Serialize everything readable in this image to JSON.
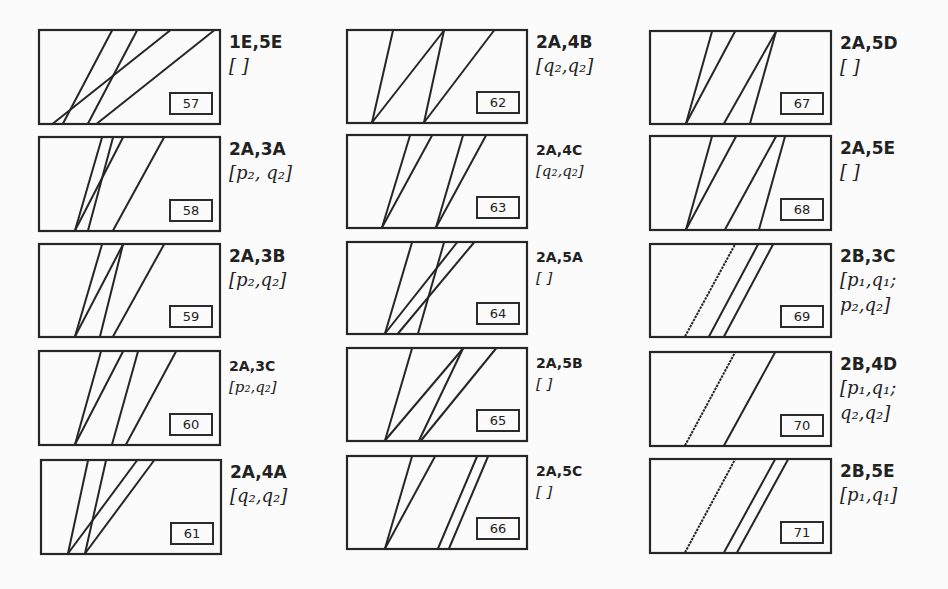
{
  "figure": {
    "panels": [
      {
        "id": "57",
        "x": 38,
        "y": 29,
        "w": 183,
        "h": 96,
        "code": "1E,5E",
        "state": "[ ]",
        "size": "big",
        "lines": [
          [
            15,
            132
          ],
          [
            25,
            74
          ],
          [
            50,
            99
          ],
          [
            59,
            176
          ]
        ],
        "dashed": []
      },
      {
        "id": "58",
        "x": 38,
        "y": 136,
        "w": 183,
        "h": 96,
        "code": "2A,3A",
        "state": "[p₂, q₂]",
        "size": "big",
        "lines": [
          [
            37,
            64
          ],
          [
            37,
            85
          ],
          [
            50,
            75
          ],
          [
            75,
            126
          ]
        ],
        "dashed": []
      },
      {
        "id": "59",
        "x": 38,
        "y": 243,
        "w": 183,
        "h": 95,
        "code": "2A,3B",
        "state": "[p₂,q₂]",
        "size": "big",
        "lines": [
          [
            37,
            64
          ],
          [
            37,
            85
          ],
          [
            62,
            85
          ],
          [
            75,
            126
          ]
        ],
        "dashed": []
      },
      {
        "id": "60",
        "x": 38,
        "y": 350,
        "w": 183,
        "h": 96,
        "code": "2A,3C",
        "state": "[p₂,q₂]",
        "size": "small",
        "lines": [
          [
            37,
            63
          ],
          [
            37,
            85
          ],
          [
            74,
            100
          ],
          [
            88,
            138
          ]
        ],
        "dashed": []
      },
      {
        "id": "61",
        "x": 40,
        "y": 459,
        "w": 182,
        "h": 96,
        "code": "2A,4A",
        "state": "[q₂,q₂]",
        "size": "big",
        "lines": [
          [
            28,
            48
          ],
          [
            28,
            97
          ],
          [
            45,
            66
          ],
          [
            45,
            114
          ]
        ],
        "dashed": []
      },
      {
        "id": "62",
        "x": 346,
        "y": 29,
        "w": 182,
        "h": 95,
        "code": "2A,4B",
        "state": "[q₂,q₂]",
        "size": "big",
        "lines": [
          [
            26,
            47
          ],
          [
            26,
            98
          ],
          [
            78,
            98
          ],
          [
            78,
            148
          ]
        ],
        "dashed": []
      },
      {
        "id": "63",
        "x": 346,
        "y": 134,
        "w": 182,
        "h": 95,
        "code": "2A,4C",
        "state": "[q₂,q₂]",
        "size": "small",
        "lines": [
          [
            36,
            64
          ],
          [
            36,
            86
          ],
          [
            90,
            117
          ],
          [
            90,
            140
          ]
        ],
        "dashed": []
      },
      {
        "id": "64",
        "x": 346,
        "y": 241,
        "w": 182,
        "h": 94,
        "code": "2A,5A",
        "state": "[ ]",
        "size": "small",
        "lines": [
          [
            39,
            66
          ],
          [
            39,
            111
          ],
          [
            52,
            128
          ],
          [
            72,
            98
          ]
        ],
        "dashed": []
      },
      {
        "id": "65",
        "x": 346,
        "y": 347,
        "w": 182,
        "h": 95,
        "code": "2A,5B",
        "state": "[ ]",
        "size": "small",
        "lines": [
          [
            39,
            66
          ],
          [
            39,
            117
          ],
          [
            73,
            117
          ],
          [
            75,
            150
          ]
        ],
        "dashed": []
      },
      {
        "id": "66",
        "x": 346,
        "y": 455,
        "w": 182,
        "h": 95,
        "code": "2A,5C",
        "state": "[ ]",
        "size": "small",
        "lines": [
          [
            39,
            66
          ],
          [
            39,
            89
          ],
          [
            92,
            131
          ],
          [
            103,
            142
          ]
        ],
        "dashed": []
      },
      {
        "id": "67",
        "x": 649,
        "y": 30,
        "w": 183,
        "h": 95,
        "code": "2A,5D",
        "state": "[ ]",
        "size": "big",
        "lines": [
          [
            37,
            63
          ],
          [
            37,
            86
          ],
          [
            75,
            127
          ],
          [
            101,
            127
          ]
        ],
        "dashed": []
      },
      {
        "id": "68",
        "x": 649,
        "y": 135,
        "w": 183,
        "h": 96,
        "code": "2A,5E",
        "state": "[ ]",
        "size": "big",
        "lines": [
          [
            37,
            63
          ],
          [
            37,
            87
          ],
          [
            76,
            127
          ],
          [
            110,
            136
          ]
        ],
        "dashed": []
      },
      {
        "id": "69",
        "x": 649,
        "y": 243,
        "w": 183,
        "h": 95,
        "code": "2B,3C",
        "state": "[p₁,q₁;\np₂,q₂]",
        "size": "big",
        "lines": [
          [
            60,
            109
          ],
          [
            75,
            124
          ]
        ],
        "dashed": [
          [
            36,
            86
          ]
        ]
      },
      {
        "id": "70",
        "x": 649,
        "y": 351,
        "w": 183,
        "h": 96,
        "code": "2B,4D",
        "state": "[p₁,q₁;\nq₂,q₂]",
        "size": "big",
        "lines": [
          [
            75,
            126
          ]
        ],
        "dashed": [
          [
            36,
            86
          ]
        ]
      },
      {
        "id": "71",
        "x": 649,
        "y": 458,
        "w": 183,
        "h": 96,
        "code": "2B,5E",
        "state": "[p₁,q₁]",
        "size": "big",
        "lines": [
          [
            75,
            126
          ],
          [
            88,
            139
          ]
        ],
        "dashed": [
          [
            36,
            86
          ]
        ]
      }
    ]
  },
  "style": {
    "stroke": "#262626",
    "background": "#fbfbfb"
  }
}
